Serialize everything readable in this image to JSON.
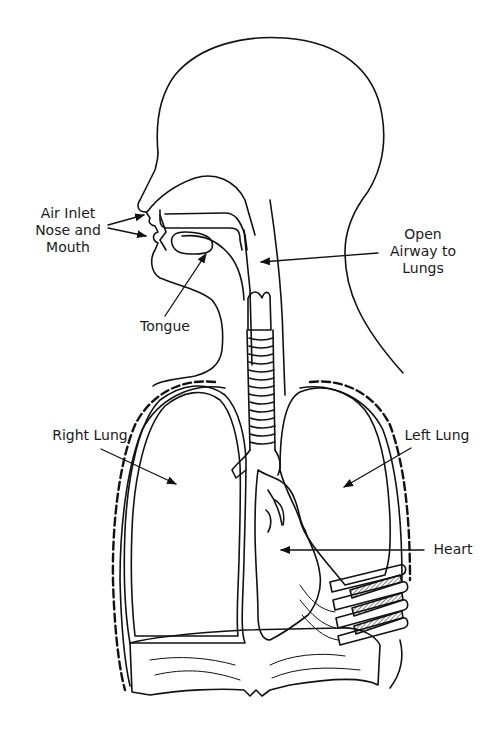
{
  "diagram": {
    "type": "anatomical-line-drawing",
    "stroke_color": "#111111",
    "background": "#ffffff",
    "labels": {
      "air_inlet": [
        "Air Inlet",
        "Nose and",
        "Mouth"
      ],
      "tongue": "Tongue",
      "open_airway": [
        "Open",
        "Airway to",
        "Lungs"
      ],
      "right_lung": "Right Lung",
      "left_lung": "Left Lung",
      "heart": "Heart"
    }
  }
}
